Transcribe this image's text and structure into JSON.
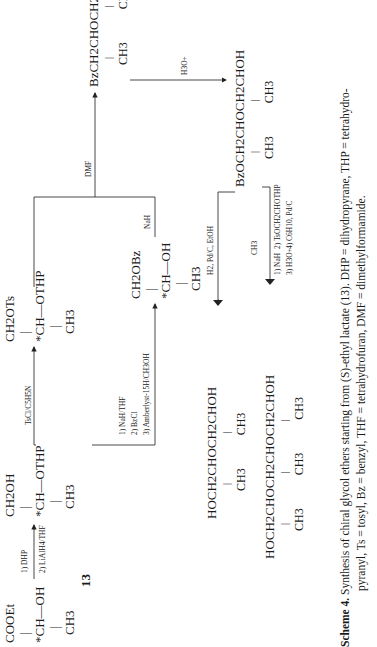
{
  "compounds": {
    "c13": {
      "top": "COOEt",
      "mid": "*CH—OH",
      "bottom": "CH3",
      "label": "13"
    },
    "alcohol_thp": {
      "top": "CH2OH",
      "mid": "*CH—OTHP",
      "bottom": "CH3"
    },
    "tosylate": {
      "top": "CH2OTs",
      "mid": "*CH—OTHP",
      "bottom": "CH3"
    },
    "benzyl_alcohol": {
      "top": "CH2OBz",
      "mid": "*CH—OH",
      "bottom": "CH3"
    },
    "bz_thp_ether": {
      "main": "BzCH2CHOCH2CHOTHP",
      "subs": [
        "CH3",
        "CH3"
      ]
    },
    "bz_diol_ether": {
      "main": "BzOCH2CHOCH2CHOH",
      "subs": [
        "CH3",
        "CH3"
      ]
    },
    "dimer": {
      "main": "HOCH2CHOCH2CHOH",
      "subs": [
        "CH3",
        "CH3"
      ]
    },
    "trimer": {
      "main": "HOCH2CHOCH2CHOCH2CHOH",
      "subs": [
        "CH3",
        "CH3",
        "CH3"
      ]
    }
  },
  "reagents": {
    "step1": [
      "1) DHP",
      "2) LiAlH4/THF"
    ],
    "tosylation": "TsCl/C5H5N",
    "benzylation": [
      "1) NaH/THF",
      "2) BzCl",
      "3) Amberlyst-15H/CH3OH"
    ],
    "nah": "NaH",
    "dmf": "DMF",
    "hydrolysis": "H3O+",
    "hydrogenolysis": "H2, Pd/C, EtOH",
    "trimer_steps": [
      "1) NaH",
      "2) TsOCH2CHOTHP",
      "3) H3O+",
      "4) C6H10, Pd/C"
    ],
    "trimer_reagent_sub": "CH3"
  },
  "caption": {
    "label": "Scheme 4.",
    "line1": "Synthesis of chiral glycol ethers starting from (S)-ethyl lactate (13). DHP = dihydropyrane, THP = tetrahydro-",
    "line2": "pyranyl, Ts = tosyl, Bz = benzyl, THF = tetrahydrofuran, DMF = dimethylformamide."
  }
}
